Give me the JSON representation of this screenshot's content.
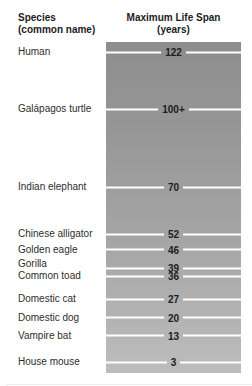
{
  "headers": {
    "left": "Species\n(common name)",
    "right": "Maximum Life Span\n(years)"
  },
  "chart_data": {
    "type": "bar",
    "orientation": "vertical-scale",
    "title": "",
    "xlabel": "Species (common name)",
    "ylabel": "Maximum Life Span (years)",
    "axis_ticks_visible": false,
    "grid": false,
    "legend": "none",
    "value_range_shown": [
      0,
      126
    ],
    "points": [
      {
        "species": "Human",
        "value": 122,
        "value_label": "122"
      },
      {
        "species": "Galápagos turtle",
        "value": 100,
        "value_label": "100+"
      },
      {
        "species": "Indian elephant",
        "value": 70,
        "value_label": "70"
      },
      {
        "species": "Chinese alligator",
        "value": 52,
        "value_label": "52"
      },
      {
        "species": "Golden eagle",
        "value": 46,
        "value_label": "46"
      },
      {
        "species": "Gorilla",
        "value": 39,
        "value_label": "39"
      },
      {
        "species": "Common toad",
        "value": 36,
        "value_label": "36"
      },
      {
        "species": "Domestic cat",
        "value": 27,
        "value_label": "27"
      },
      {
        "species": "Domestic dog",
        "value": 20,
        "value_label": "20"
      },
      {
        "species": "Vampire bat",
        "value": 13,
        "value_label": "13"
      },
      {
        "species": "House mouse",
        "value": 3,
        "value_label": "3"
      }
    ],
    "colors": {
      "bar_gradient_top": "#8d8d8d",
      "bar_gradient_bottom": "#bdbdbd",
      "tick_line": "#ffffff",
      "value_text": "#1d1d1d",
      "label_text": "#2d2d2d",
      "header_text": "#1c1c1c",
      "background": "#ffffff"
    }
  }
}
